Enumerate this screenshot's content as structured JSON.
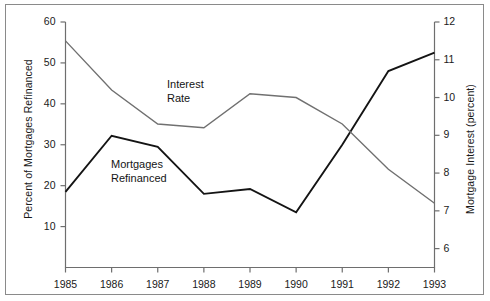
{
  "chart_data": {
    "type": "line",
    "title": "",
    "subtitle": "",
    "xlabel": "",
    "ylabel": "Percent of Mortgages Refinanced",
    "y2label": "Mortgage Interest (percent)",
    "grid": false,
    "legend_position": "inline-annotations",
    "x": [
      1985,
      1986,
      1987,
      1988,
      1989,
      1990,
      1991,
      1992,
      1993
    ],
    "xtick_labels": [
      "1985",
      "1986",
      "1987",
      "1988",
      "1989",
      "1990",
      "1991",
      "1992",
      "1993"
    ],
    "ylim": [
      0,
      60
    ],
    "ytick_labels": [
      "10",
      "20",
      "30",
      "40",
      "50",
      "60"
    ],
    "yticks": [
      10,
      20,
      30,
      40,
      50,
      60
    ],
    "y2lim": [
      5.5,
      12
    ],
    "y2tick_labels": [
      "6",
      "7",
      "8",
      "9",
      "10",
      "11",
      "12"
    ],
    "y2ticks": [
      6,
      7,
      8,
      9,
      10,
      11,
      12
    ],
    "series": [
      {
        "name": "Mortgages Refinanced",
        "axis": "left",
        "color": "#141414",
        "values": [
          18.5,
          32.2,
          29.5,
          18.0,
          19.2,
          13.5,
          30.0,
          48.0,
          52.5
        ]
      },
      {
        "name": "Interest Rate",
        "axis": "right",
        "color": "#707070",
        "values": [
          11.5,
          10.2,
          9.3,
          9.2,
          10.1,
          10.0,
          9.3,
          8.1,
          7.2
        ]
      }
    ],
    "annotations": [
      {
        "text_line_1": "Interest",
        "text_line_2": "Rate",
        "for_series": "Interest Rate"
      },
      {
        "text_line_1": "Mortgages",
        "text_line_2": "Refinanced",
        "for_series": "Mortgages Refinanced"
      }
    ]
  },
  "axes": {
    "left_title": "Percent of Mortgages Refinanced",
    "right_title": "Mortgage Interest (percent)"
  },
  "labels": {
    "interest_rate_line_1": "Interest",
    "interest_rate_line_2": "Rate",
    "mortgages_line_1": "Mortgages",
    "mortgages_line_2": "Refinanced"
  },
  "colors": {
    "mortgages_line": "#141414",
    "interest_line": "#707070",
    "axis": "#6e6e6e",
    "frame": "#8a8a8a",
    "text": "#1a1a1a",
    "background": "#ffffff"
  }
}
